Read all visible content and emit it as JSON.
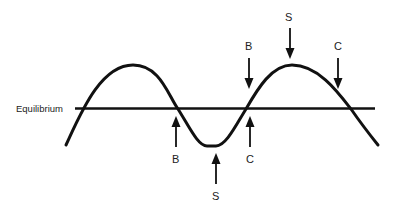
{
  "diagram": {
    "title": "",
    "equilibrium_label": "Equilibrium",
    "colors": {
      "line": "#111111",
      "text": "#222222",
      "background": "#ffffff"
    },
    "markers": [
      {
        "label": "S",
        "position": "crest",
        "direction": "down"
      },
      {
        "label": "B",
        "position": "rising-crossing-upper",
        "direction": "down"
      },
      {
        "label": "C",
        "position": "falling-after-crest",
        "direction": "down"
      },
      {
        "label": "B",
        "position": "falling-crossing",
        "direction": "up"
      },
      {
        "label": "S",
        "position": "trough",
        "direction": "up"
      },
      {
        "label": "C",
        "position": "rising-crossing",
        "direction": "up"
      }
    ]
  }
}
